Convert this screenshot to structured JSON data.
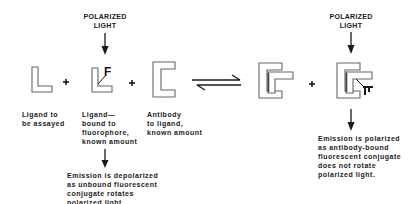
{
  "diagram": {
    "type": "fluorescence-polarization-immunoassay",
    "light_labels": [
      {
        "line1": "POLARIZED",
        "line2": "LIGHT"
      },
      {
        "line1": "POLARIZED",
        "line2": "LIGHT"
      }
    ],
    "components": [
      {
        "id": "ligand",
        "label": "Ligand to\nbe assayed"
      },
      {
        "id": "labeled-ligand",
        "label": "Ligand—\nbound to\nfluorophore,\nknown amount",
        "marker": "F"
      },
      {
        "id": "antibody",
        "label": "Antibody\nto ligand,\nknown amount"
      }
    ],
    "operators": [
      "+",
      "+",
      "+"
    ],
    "equilibrium": "reversible",
    "outcomes": [
      {
        "id": "unbound",
        "text": "Emission is depolarized\nas unbound fluorescent\nconjugate rotates\npolarized light."
      },
      {
        "id": "bound",
        "text": "Emission is polarized\nas antibody-bound\nfluorescent conjugate\ndoes not rotate\npolarized light."
      }
    ],
    "colors": {
      "ink": "#1a1a1a",
      "shape_stroke": "#555555",
      "shape_fill": "#ffffff"
    }
  }
}
